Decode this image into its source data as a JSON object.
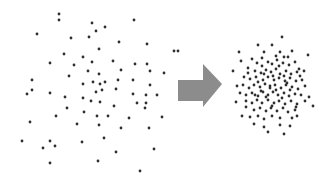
{
  "diagram": {
    "colors": {
      "dot": "#2f2f2f",
      "arrow": "#8c8c8c",
      "background": "#ffffff"
    },
    "dot_radius": 1.4,
    "arrow": {
      "direction": "right",
      "points": [
        [
          178,
          80
        ],
        [
          203,
          80
        ],
        [
          203,
          64
        ],
        [
          222,
          84
        ],
        [
          203,
          107
        ],
        [
          203,
          101
        ],
        [
          178,
          101
        ]
      ]
    },
    "scattered_points": [
      [
        59,
        14
      ],
      [
        59,
        20
      ],
      [
        37,
        34
      ],
      [
        71,
        38
      ],
      [
        92,
        23
      ],
      [
        96,
        31
      ],
      [
        105,
        27
      ],
      [
        89,
        37
      ],
      [
        134,
        20
      ],
      [
        119,
        42
      ],
      [
        99,
        49
      ],
      [
        64,
        54
      ],
      [
        50,
        63
      ],
      [
        74,
        65
      ],
      [
        83,
        57
      ],
      [
        92,
        62
      ],
      [
        113,
        61
      ],
      [
        174,
        51
      ],
      [
        147,
        44
      ],
      [
        135,
        64
      ],
      [
        147,
        64
      ],
      [
        150,
        71
      ],
      [
        164,
        73
      ],
      [
        121,
        70
      ],
      [
        99,
        74
      ],
      [
        88,
        71
      ],
      [
        69,
        76
      ],
      [
        32,
        80
      ],
      [
        32,
        90
      ],
      [
        27,
        94
      ],
      [
        50,
        93
      ],
      [
        65,
        97
      ],
      [
        83,
        84
      ],
      [
        93,
        82
      ],
      [
        100,
        84
      ],
      [
        105,
        82
      ],
      [
        118,
        80
      ],
      [
        133,
        80
      ],
      [
        150,
        85
      ],
      [
        157,
        95
      ],
      [
        146,
        95
      ],
      [
        133,
        94
      ],
      [
        137,
        103
      ],
      [
        146,
        103
      ],
      [
        145,
        108
      ],
      [
        116,
        89
      ],
      [
        102,
        90
      ],
      [
        96,
        92
      ],
      [
        91,
        101
      ],
      [
        83,
        98
      ],
      [
        67,
        108
      ],
      [
        84,
        112
      ],
      [
        97,
        116
      ],
      [
        108,
        116
      ],
      [
        114,
        106
      ],
      [
        100,
        102
      ],
      [
        56,
        116
      ],
      [
        30,
        122
      ],
      [
        77,
        124
      ],
      [
        99,
        125
      ],
      [
        129,
        118
      ],
      [
        121,
        128
      ],
      [
        149,
        128
      ],
      [
        162,
        117
      ],
      [
        22,
        141
      ],
      [
        50,
        141
      ],
      [
        55,
        146
      ],
      [
        43,
        148
      ],
      [
        82,
        142
      ],
      [
        104,
        138
      ],
      [
        116,
        152
      ],
      [
        154,
        149
      ],
      [
        50,
        163
      ],
      [
        98,
        161
      ],
      [
        140,
        171
      ],
      [
        178,
        51
      ]
    ],
    "cluster_points": [
      [
        282,
        37
      ],
      [
        258,
        45
      ],
      [
        272,
        45
      ],
      [
        239,
        52
      ],
      [
        264,
        52
      ],
      [
        280,
        52
      ],
      [
        292,
        51
      ],
      [
        252,
        59
      ],
      [
        276,
        56
      ],
      [
        284,
        57
      ],
      [
        308,
        55
      ],
      [
        241,
        61
      ],
      [
        257,
        63
      ],
      [
        262,
        66
      ],
      [
        268,
        62
      ],
      [
        272,
        64
      ],
      [
        277,
        60
      ],
      [
        283,
        63
      ],
      [
        289,
        65
      ],
      [
        295,
        62
      ],
      [
        299,
        69
      ],
      [
        233,
        71
      ],
      [
        248,
        68
      ],
      [
        255,
        71
      ],
      [
        261,
        73
      ],
      [
        266,
        70
      ],
      [
        271,
        72
      ],
      [
        276,
        69
      ],
      [
        280,
        74
      ],
      [
        286,
        71
      ],
      [
        291,
        74
      ],
      [
        297,
        72
      ],
      [
        304,
        71
      ],
      [
        244,
        77
      ],
      [
        250,
        79
      ],
      [
        256,
        77
      ],
      [
        263,
        80
      ],
      [
        268,
        77
      ],
      [
        274,
        80
      ],
      [
        279,
        78
      ],
      [
        285,
        81
      ],
      [
        290,
        78
      ],
      [
        296,
        81
      ],
      [
        302,
        80
      ],
      [
        237,
        86
      ],
      [
        243,
        85
      ],
      [
        249,
        88
      ],
      [
        254,
        85
      ],
      [
        260,
        87
      ],
      [
        265,
        84
      ],
      [
        270,
        86
      ],
      [
        275,
        85
      ],
      [
        281,
        88
      ],
      [
        286,
        85
      ],
      [
        292,
        87
      ],
      [
        298,
        89
      ],
      [
        305,
        86
      ],
      [
        240,
        93
      ],
      [
        246,
        95
      ],
      [
        252,
        93
      ],
      [
        258,
        96
      ],
      [
        263,
        92
      ],
      [
        268,
        95
      ],
      [
        273,
        92
      ],
      [
        278,
        95
      ],
      [
        284,
        93
      ],
      [
        289,
        96
      ],
      [
        295,
        94
      ],
      [
        301,
        95
      ],
      [
        246,
        101
      ],
      [
        252,
        103
      ],
      [
        257,
        100
      ],
      [
        262,
        103
      ],
      [
        268,
        100
      ],
      [
        274,
        103
      ],
      [
        279,
        101
      ],
      [
        285,
        104
      ],
      [
        291,
        101
      ],
      [
        297,
        104
      ],
      [
        309,
        97
      ],
      [
        254,
        110
      ],
      [
        260,
        108
      ],
      [
        266,
        111
      ],
      [
        271,
        108
      ],
      [
        277,
        111
      ],
      [
        283,
        108
      ],
      [
        288,
        112
      ],
      [
        295,
        110
      ],
      [
        305,
        101
      ],
      [
        242,
        116
      ],
      [
        250,
        117
      ],
      [
        258,
        116
      ],
      [
        264,
        119
      ],
      [
        272,
        116
      ],
      [
        280,
        118
      ],
      [
        292,
        118
      ],
      [
        297,
        116
      ],
      [
        254,
        124
      ],
      [
        264,
        127
      ],
      [
        280,
        125
      ],
      [
        290,
        126
      ],
      [
        268,
        132
      ],
      [
        284,
        134
      ],
      [
        246,
        107
      ],
      [
        236,
        102
      ],
      [
        313,
        106
      ],
      [
        262,
        58
      ],
      [
        288,
        57
      ],
      [
        270,
        88
      ],
      [
        276,
        90
      ],
      [
        266,
        97
      ],
      [
        282,
        98
      ],
      [
        258,
        82
      ],
      [
        287,
        83
      ],
      [
        272,
        106
      ],
      [
        264,
        74
      ],
      [
        279,
        66
      ],
      [
        296,
        107
      ],
      [
        248,
        73
      ],
      [
        300,
        76
      ],
      [
        255,
        95
      ],
      [
        290,
        90
      ],
      [
        273,
        76
      ],
      [
        261,
        91
      ],
      [
        284,
        76
      ]
    ]
  }
}
